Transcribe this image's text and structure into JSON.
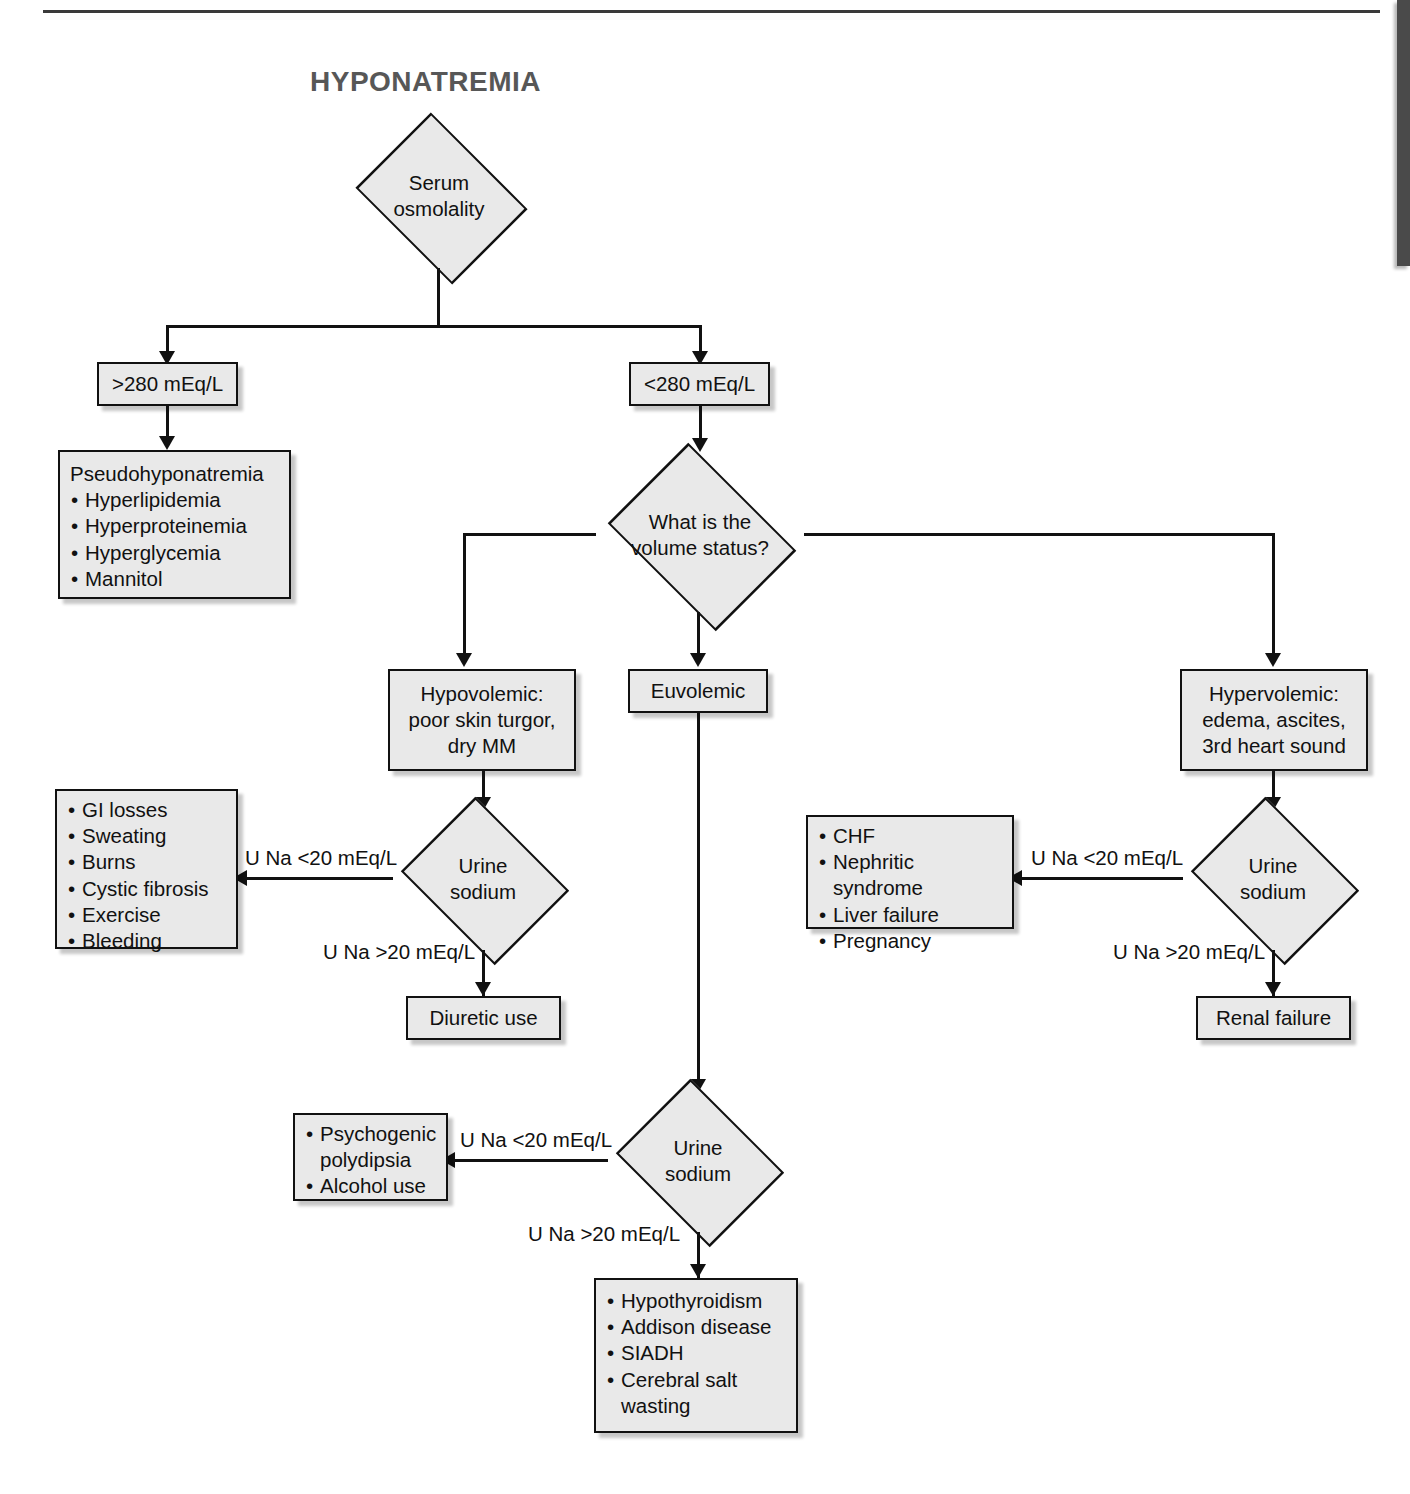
{
  "title": "HYPONATREMIA",
  "nodes": {
    "serum_osmolality": "Serum\nosmolality",
    "high_osm": ">280 mEq/L",
    "low_osm": "<280 mEq/L",
    "pseudo_heading": "Pseudohyponatremia",
    "pseudo_items": [
      "Hyperlipidemia",
      "Hyperproteinemia",
      "Hyperglycemia",
      "Mannitol"
    ],
    "volume_status": "What is the\nvolume status?",
    "hypovolemic": "Hypovolemic:\npoor skin turgor,\ndry MM",
    "euvolemic": "Euvolemic",
    "hypervolemic": "Hypervolemic:\nedema, ascites,\n3rd heart sound",
    "urine_sodium": "Urine\nsodium",
    "hypovolemic_low_items": [
      "GI losses",
      "Sweating",
      "Burns",
      "Cystic fibrosis",
      "Exercise",
      "Bleeding"
    ],
    "diuretic_use": "Diuretic use",
    "hypervolemic_low_items": [
      "CHF",
      "Nephritic syndrome",
      "Liver failure",
      "Pregnancy"
    ],
    "renal_failure": "Renal failure",
    "euvolemic_low_items": [
      "Psychogenic\npolydipsia",
      "Alcohol use"
    ],
    "euvolemic_high_items": [
      "Hypothyroidism",
      "Addison disease",
      "SIADH",
      "Cerebral salt\nwasting"
    ]
  },
  "edge_labels": {
    "una_low_hypo": "U Na <20 mEq/L",
    "una_high_hypo": "U Na >20 mEq/L",
    "una_low_hyper": "U Na <20 mEq/L",
    "una_high_hyper": "U Na >20 mEq/L",
    "una_low_eu": "U Na <20 mEq/L",
    "una_high_eu": "U Na >20 mEq/L"
  },
  "colors": {
    "node_fill": "#e9e9e9",
    "node_border": "#111111",
    "title": "#575757",
    "line": "#111111",
    "page_bg": "#ffffff"
  }
}
